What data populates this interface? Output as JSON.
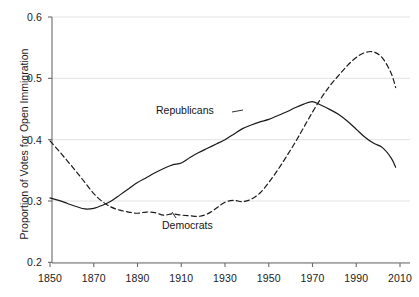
{
  "chart_data": {
    "type": "line",
    "title": "",
    "xlabel": "",
    "ylabel": "Proportion of Votes for Open Immigration",
    "xlim": [
      1845,
      2012
    ],
    "ylim": [
      0.2,
      0.6
    ],
    "xticks": [
      1850,
      1870,
      1890,
      1910,
      1930,
      1950,
      1970,
      1990,
      2010
    ],
    "xtick_labels": [
      "1850",
      "1870",
      "1890",
      "1910",
      "1930",
      "1950",
      "1970",
      "1990",
      "2010"
    ],
    "yticks": [
      0.2,
      0.3,
      0.4,
      0.5,
      0.6
    ],
    "ytick_labels": [
      "0.2",
      "0.3",
      "0.4",
      "0.5",
      "0.6"
    ],
    "grid": "horizontal",
    "legend_position": "inline-annotations",
    "annotations": [
      {
        "text": "Republicans",
        "x": 1895,
        "y": 0.425
      },
      {
        "text": "Democrats",
        "x": 1902,
        "y": 0.24
      }
    ],
    "series": [
      {
        "name": "Republicans",
        "style": "solid",
        "color": "#1a1a1a",
        "x": [
          1850,
          1854,
          1858,
          1862,
          1866,
          1870,
          1874,
          1878,
          1882,
          1886,
          1890,
          1894,
          1898,
          1902,
          1906,
          1910,
          1914,
          1918,
          1922,
          1926,
          1930,
          1934,
          1938,
          1942,
          1946,
          1950,
          1954,
          1958,
          1962,
          1966,
          1970,
          1974,
          1978,
          1982,
          1986,
          1990,
          1994,
          1998,
          2002,
          2006,
          2008
        ],
        "y": [
          0.305,
          0.301,
          0.296,
          0.291,
          0.287,
          0.288,
          0.293,
          0.3,
          0.31,
          0.32,
          0.33,
          0.338,
          0.346,
          0.353,
          0.359,
          0.362,
          0.371,
          0.379,
          0.386,
          0.393,
          0.4,
          0.409,
          0.418,
          0.424,
          0.429,
          0.433,
          0.439,
          0.445,
          0.452,
          0.458,
          0.462,
          0.456,
          0.449,
          0.441,
          0.43,
          0.417,
          0.404,
          0.394,
          0.387,
          0.37,
          0.355
        ]
      },
      {
        "name": "Democrats",
        "style": "dashed",
        "color": "#1a1a1a",
        "x": [
          1850,
          1854,
          1858,
          1862,
          1866,
          1870,
          1874,
          1878,
          1882,
          1886,
          1890,
          1894,
          1898,
          1902,
          1906,
          1910,
          1914,
          1918,
          1922,
          1926,
          1930,
          1934,
          1938,
          1942,
          1946,
          1950,
          1954,
          1958,
          1962,
          1966,
          1970,
          1974,
          1978,
          1982,
          1986,
          1990,
          1994,
          1998,
          2002,
          2006,
          2008
        ],
        "y": [
          0.398,
          0.382,
          0.365,
          0.348,
          0.33,
          0.312,
          0.299,
          0.29,
          0.285,
          0.282,
          0.28,
          0.282,
          0.281,
          0.277,
          0.279,
          0.277,
          0.276,
          0.275,
          0.279,
          0.288,
          0.298,
          0.301,
          0.299,
          0.303,
          0.313,
          0.33,
          0.35,
          0.372,
          0.395,
          0.42,
          0.445,
          0.468,
          0.488,
          0.505,
          0.521,
          0.534,
          0.542,
          0.543,
          0.533,
          0.508,
          0.485
        ]
      }
    ]
  },
  "axis": {
    "y_title": "Proportion of Votes for Open Immigration"
  }
}
